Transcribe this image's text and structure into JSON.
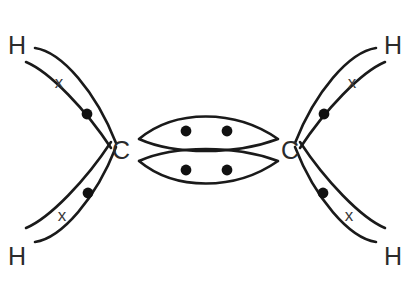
{
  "diagram": {
    "molecule": "C2H4",
    "background_color": "#ffffff",
    "stroke_color": "#1a1a1a",
    "dot_color": "#111111",
    "label_color": "#2b2b2b",
    "cross_color": "#3a3a3a"
  },
  "atoms": {
    "carbon_left": {
      "symbol": "C",
      "x": 121,
      "y": 150
    },
    "carbon_right": {
      "symbol": "C",
      "x": 290,
      "y": 150
    },
    "hydrogen_top_left": {
      "symbol": "H",
      "x": 17,
      "y": 45
    },
    "hydrogen_top_right": {
      "symbol": "H",
      "x": 393,
      "y": 45
    },
    "hydrogen_bottom_left": {
      "symbol": "H",
      "x": 17,
      "y": 256
    },
    "hydrogen_bottom_right": {
      "symbol": "H",
      "x": 393,
      "y": 256
    }
  },
  "bonds": {
    "ch_bonds": [
      {
        "name": "ch-bond-top-left",
        "outline": "M 35,48 C 62,52 96,92 116,143 M 26,62 C 50,72 86,110 111,148",
        "cross": {
          "symbol": "x",
          "x": 59,
          "y": 82
        },
        "dot": {
          "x": 87,
          "y": 114
        }
      },
      {
        "name": "ch-bond-top-right",
        "outline": "M 376,48 C 349,52 315,92 295,143 M 385,62 C 361,72 325,110 300,148",
        "cross": {
          "symbol": "x",
          "x": 352,
          "y": 82
        },
        "dot": {
          "x": 324,
          "y": 114
        }
      },
      {
        "name": "ch-bond-bottom-left",
        "outline": "M 35,242 C 62,238 96,198 116,147 M 26,228 C 50,218 86,180 111,142",
        "cross": {
          "symbol": "x",
          "x": 62,
          "y": 215
        },
        "dot": {
          "x": 88,
          "y": 193
        }
      },
      {
        "name": "ch-bond-bottom-right",
        "outline": "M 376,242 C 349,238 315,198 295,147 M 385,228 C 361,218 325,180 300,142",
        "cross": {
          "symbol": "x",
          "x": 349,
          "y": 215
        },
        "dot": {
          "x": 323,
          "y": 193
        }
      }
    ],
    "cc_double_bond": [
      {
        "name": "cc-bond-lens-upper",
        "outline": "M 139,139 C 175,109 235,109 278,139 M 139,139 C 175,155 235,155 278,139",
        "dots": [
          {
            "x": 186,
            "y": 131
          },
          {
            "x": 227,
            "y": 131
          }
        ]
      },
      {
        "name": "cc-bond-lens-lower",
        "outline": "M 139,161 C 175,145 235,145 278,161 M 139,161 C 175,191 235,191 278,161",
        "dots": [
          {
            "x": 186,
            "y": 170
          },
          {
            "x": 227,
            "y": 170
          }
        ]
      }
    ]
  },
  "legend": {
    "dot_meaning": "electron from carbon",
    "cross_meaning": "electron from hydrogen"
  }
}
